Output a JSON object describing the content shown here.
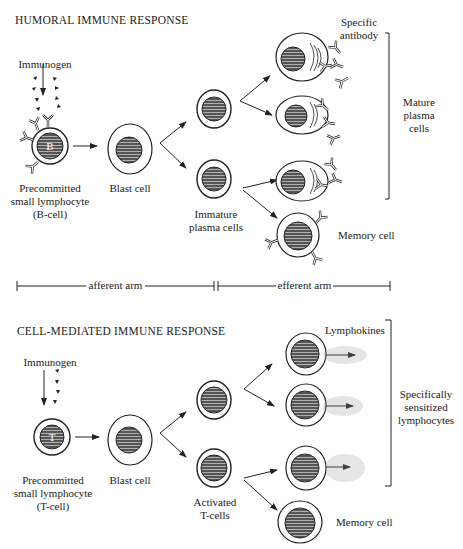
{
  "humoral": {
    "title": "HUMORAL IMMUNE RESPONSE",
    "immunogen": "Immunogen",
    "cell_letter": "B",
    "precommitted": [
      "Precommitted",
      "small lymphocyte",
      "(B-cell)"
    ],
    "blast": "Blast cell",
    "immature": [
      "Immature",
      "plasma cells"
    ],
    "specific_antibody": [
      "Specific",
      "antibody"
    ],
    "mature": [
      "Mature",
      "plasma",
      "cells"
    ],
    "memory": "Memory cell"
  },
  "arms": {
    "afferent": "afferent arm",
    "efferent": "efferent arm"
  },
  "cell_mediated": {
    "title": "CELL-MEDIATED IMMUNE RESPONSE",
    "immunogen": "Immunogen",
    "cell_letter": "T",
    "precommitted": [
      "Precommitted",
      "small lymphocyte",
      "(T-cell)"
    ],
    "blast": "Blast cell",
    "activated": [
      "Activated",
      "T-cells"
    ],
    "lymphokines": "Lymphokines",
    "sensitized": [
      "Specifically",
      "sensitized",
      "lymphocytes"
    ],
    "memory": "Memory cell"
  },
  "colors": {
    "ink": "#222222",
    "nucleus": "#555555",
    "background": "#ffffff"
  }
}
